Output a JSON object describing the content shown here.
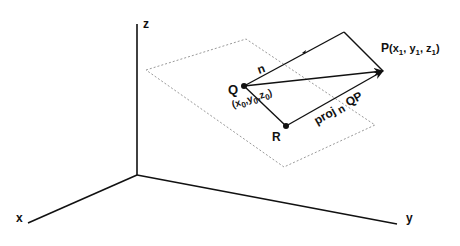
{
  "diagram": {
    "axes": {
      "x_label": "x",
      "y_label": "y",
      "z_label": "z"
    },
    "points": {
      "P": {
        "name": "P",
        "coords_label": "(x",
        "x_sub": "1",
        "y": "y",
        "y_sub": "1",
        "z": "z",
        "z_sub": "1"
      },
      "Q": {
        "name": "Q",
        "x": "(x",
        "x_sub": "0",
        "y": "y",
        "y_sub": "0",
        "z": "z",
        "z_sub": "0"
      },
      "R": {
        "name": "R"
      }
    },
    "vectors": {
      "n_label": "n",
      "proj_label": "proj",
      "proj_sub": "n",
      "proj_vec": "QP"
    },
    "colors": {
      "stroke": "#111111",
      "plane": "#9a9a9a",
      "background": "#ffffff"
    }
  }
}
